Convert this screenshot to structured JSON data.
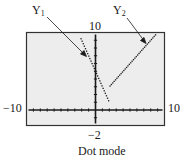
{
  "figure": {
    "caption": "Dot mode",
    "labels": {
      "y1": {
        "letter": "Y",
        "sub": "1"
      },
      "y2": {
        "letter": "Y",
        "sub": "2"
      },
      "ymax": "10",
      "ymin": "−2",
      "xmin": "−10",
      "xmax": "10"
    },
    "window": {
      "xmin": -10,
      "xmax": 10,
      "ymin": -2,
      "ymax": 10,
      "xscl": 1,
      "yscl": 1
    },
    "colors": {
      "screen_bg": "#ededed",
      "ink": "#1a1a1a",
      "border": "#333333"
    }
  },
  "chart_data": {
    "type": "scatter",
    "title": "Dot mode",
    "xlabel": "",
    "ylabel": "",
    "xlim": [
      -10,
      10
    ],
    "ylim": [
      -2,
      10
    ],
    "grid": false,
    "series": [
      {
        "name": "Y1",
        "expr": "-2x+5",
        "domain": [
          -2.1,
          1.9
        ],
        "marker": "dot"
      },
      {
        "name": "Y2",
        "expr": "x+1",
        "domain": [
          2.1,
          8.8
        ],
        "marker": "dot"
      }
    ],
    "annotations": [
      "Y1 arrow",
      "Y2 arrow",
      "10 (Ymax)",
      "-2 (Ymin)",
      "-10 (Xmin)",
      "10 (Xmax)"
    ]
  }
}
